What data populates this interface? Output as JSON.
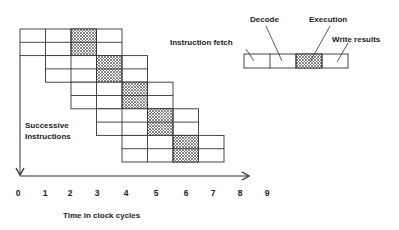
{
  "diagram": {
    "type": "instruction-pipeline",
    "stages": [
      "Instruction fetch",
      "Decode",
      "Execution",
      "Write results"
    ],
    "hatched_stage_index": 2,
    "y_axis_label_line1": "Successive",
    "y_axis_label_line2": "Instructions",
    "x_axis_label": "Time in clock cycles",
    "x_ticks": [
      "0",
      "1",
      "2",
      "3",
      "4",
      "5",
      "6",
      "7",
      "8",
      "9"
    ],
    "instruction_count": 10,
    "colors": {
      "line": "#333333",
      "hatch": "#555555",
      "background": "#ffffff"
    }
  },
  "legend": {
    "fetch": "Instruction fetch",
    "decode": "Decode",
    "execution": "Execution",
    "write": "Write results"
  }
}
